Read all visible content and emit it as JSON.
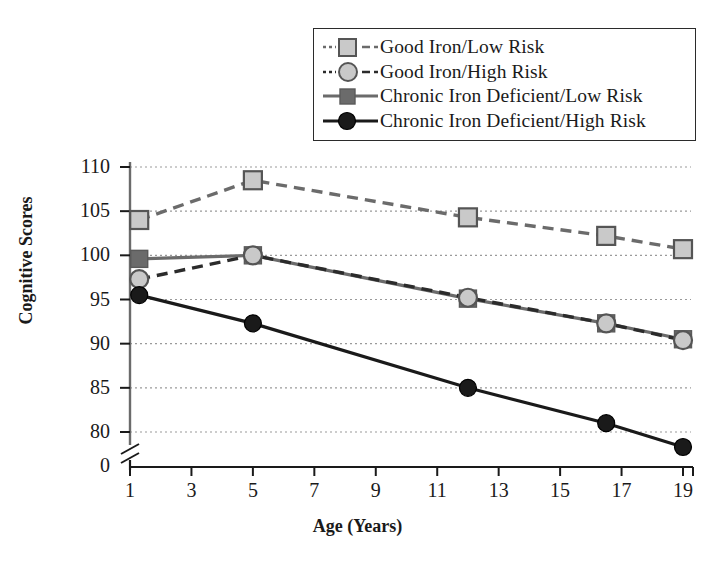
{
  "chart_data": {
    "type": "line",
    "title": "",
    "xlabel": "Age (Years)",
    "ylabel": "Cognitive Scores",
    "xlim": [
      1,
      19
    ],
    "ylim": [
      78,
      110
    ],
    "xticks": [
      1,
      3,
      5,
      7,
      9,
      11,
      13,
      15,
      17,
      19
    ],
    "yticks": [
      80,
      85,
      90,
      95,
      100,
      105,
      110
    ],
    "grid": true,
    "axis_break_y": true,
    "axis_break_label": "0",
    "legend_position": "top-right",
    "x": [
      1.3,
      5,
      12,
      16.5,
      19
    ],
    "series": [
      {
        "name": "Good Iron/Low Risk",
        "values": [
          104.0,
          108.5,
          104.3,
          102.2,
          100.7
        ],
        "color": "#c9c9c9",
        "line_color": "#6b6b6b",
        "marker": "square",
        "dash": "dashed"
      },
      {
        "name": "Good Iron/High Risk",
        "values": [
          97.3,
          100.0,
          95.2,
          92.3,
          90.4
        ],
        "color": "#c9c9c9",
        "line_color": "#2b2b2b",
        "marker": "circle",
        "dash": "dashed"
      },
      {
        "name": "Chronic Iron Deficient/Low Risk",
        "values": [
          99.6,
          100.0,
          95.1,
          92.3,
          90.5
        ],
        "color": "#6b6b6b",
        "line_color": "#6b6b6b",
        "marker": "square",
        "dash": "solid"
      },
      {
        "name": "Chronic Iron Deficient/High Risk",
        "values": [
          95.5,
          92.3,
          85.0,
          81.0,
          78.3
        ],
        "color": "#1a1a1a",
        "line_color": "#1a1a1a",
        "marker": "circle",
        "dash": "solid"
      }
    ]
  },
  "legend": {
    "items": [
      {
        "label": "Good Iron/Low Risk"
      },
      {
        "label": "Good Iron/High Risk"
      },
      {
        "label": "Chronic Iron Deficient/Low Risk"
      },
      {
        "label": "Chronic Iron Deficient/High Risk"
      }
    ]
  },
  "axes": {
    "y_title": "Cognitive Scores",
    "x_title": "Age (Years)",
    "y_ticks": [
      "110",
      "105",
      "100",
      "95",
      "90",
      "85",
      "80"
    ],
    "x_ticks": [
      "1",
      "3",
      "5",
      "7",
      "9",
      "11",
      "13",
      "15",
      "17",
      "19"
    ],
    "origin_label": "0"
  }
}
